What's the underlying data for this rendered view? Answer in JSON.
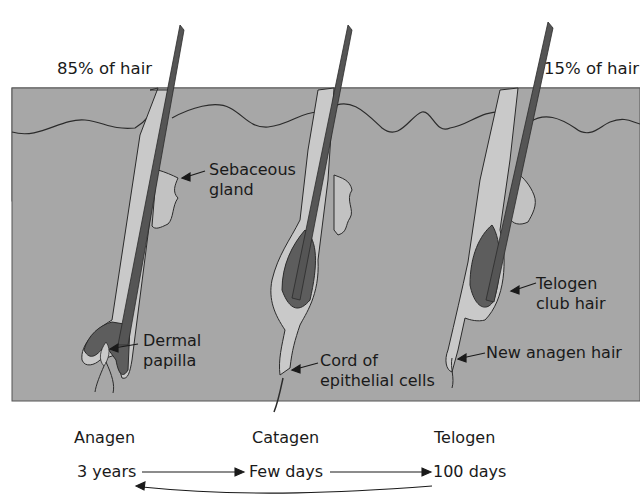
{
  "top_labels": {
    "left": "85% of hair",
    "right": "15% of hair"
  },
  "callouts": {
    "sebaceous_gland": [
      "Sebaceous",
      "gland"
    ],
    "dermal_papilla": [
      "Dermal",
      "papilla"
    ],
    "cord_epithelial": [
      "Cord of",
      "epithelial cells"
    ],
    "telogen_club_hair": [
      "Telogen",
      "club hair"
    ],
    "new_anagen_hair": "New anagen hair"
  },
  "phases": [
    {
      "name": "Anagen",
      "duration": "3 years"
    },
    {
      "name": "Catagen",
      "duration": "Few days"
    },
    {
      "name": "Telogen",
      "duration": "100 days"
    }
  ],
  "colors": {
    "skin": "#a7a7a7",
    "hair_shaft": "#555555",
    "sheath": "#c9c9c9",
    "outline": "#2b2b2b",
    "background": "#ffffff"
  }
}
